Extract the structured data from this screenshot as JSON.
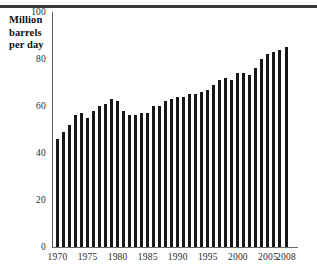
{
  "figure": {
    "axis_title_lines": [
      "Million",
      "barrels",
      "per day"
    ],
    "rule_color": "#3a3a3a",
    "bar_color": "#171717"
  },
  "chart_data": {
    "type": "bar",
    "title": "",
    "subtitle": "",
    "xlabel": "",
    "ylabel": "Million barrels per day",
    "ylim": [
      0,
      100
    ],
    "yticks": [
      0,
      20,
      40,
      60,
      80,
      100
    ],
    "ytick_labels": [
      "0",
      "20",
      "40",
      "60",
      "80",
      "100"
    ],
    "xticks": [
      1970,
      1975,
      1980,
      1985,
      1990,
      1995,
      2000,
      2005,
      2008
    ],
    "xtick_labels": [
      "1970",
      "1975",
      "1980",
      "1985",
      "1990",
      "1995",
      "2000",
      "2005",
      "2008"
    ],
    "grid": false,
    "legend": null,
    "categories": [
      "1970",
      "1971",
      "1972",
      "1973",
      "1974",
      "1975",
      "1976",
      "1977",
      "1978",
      "1979",
      "1980",
      "1981",
      "1982",
      "1983",
      "1984",
      "1985",
      "1986",
      "1987",
      "1988",
      "1989",
      "1990",
      "1991",
      "1992",
      "1993",
      "1994",
      "1995",
      "1996",
      "1997",
      "1998",
      "1999",
      "2000",
      "2001",
      "2002",
      "2003",
      "2004",
      "2005",
      "2006",
      "2007",
      "2008"
    ],
    "values": [
      46,
      49,
      52,
      56,
      57,
      55,
      58,
      60,
      61,
      63,
      62,
      58,
      56,
      56,
      57,
      57,
      60,
      60,
      62,
      63,
      64,
      64,
      65,
      65,
      66,
      67,
      69,
      71,
      72,
      71,
      74,
      74,
      73,
      76,
      80,
      82,
      83,
      84,
      85
    ],
    "units": "million barrels per day",
    "value_min": 46,
    "value_max": 85
  }
}
